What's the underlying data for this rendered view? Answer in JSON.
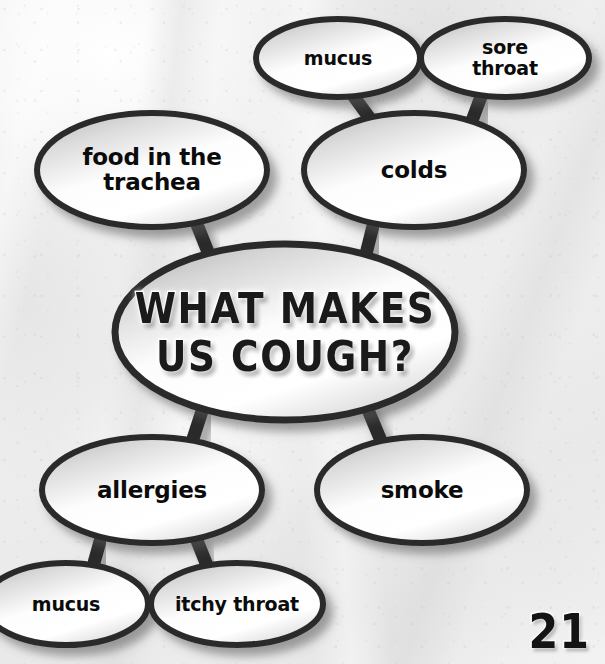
{
  "page": {
    "number": "21",
    "kind": "concept-map-worksheet",
    "palette": {
      "background": "#efefef",
      "ellipse_outline": "#2b2b2b",
      "ellipse_fill_light": "#ffffff",
      "ellipse_fill_shade": "#b9b9b9",
      "text": "#0b0b0b",
      "title_fill": "#1a1a1a",
      "title_outline": "#ffffff"
    }
  },
  "diagram": {
    "title_lines": [
      "WHAT MAKES",
      "US COUGH?"
    ],
    "center_node": {
      "id": "center",
      "label": "WHAT MAKES\nUS COUGH?",
      "cx": 285,
      "cy": 332,
      "rx": 170,
      "ry": 88
    },
    "nodes": [
      {
        "id": "mucus-top",
        "label": "mucus",
        "cx": 338,
        "cy": 58,
        "rx": 82,
        "ry": 39,
        "size": "sm"
      },
      {
        "id": "sore-throat",
        "label": "sore throat",
        "cx": 505,
        "cy": 58,
        "rx": 84,
        "ry": 39,
        "size": "sm"
      },
      {
        "id": "trachea",
        "label": "food in the\ntrachea",
        "cx": 152,
        "cy": 170,
        "rx": 115,
        "ry": 57,
        "size": "md"
      },
      {
        "id": "colds",
        "label": "colds",
        "cx": 414,
        "cy": 170,
        "rx": 110,
        "ry": 57,
        "size": "md"
      },
      {
        "id": "allergies",
        "label": "allergies",
        "cx": 152,
        "cy": 490,
        "rx": 110,
        "ry": 53,
        "size": "md"
      },
      {
        "id": "smoke",
        "label": "smoke",
        "cx": 422,
        "cy": 490,
        "rx": 105,
        "ry": 53,
        "size": "md"
      },
      {
        "id": "mucus-bottom",
        "label": "mucus",
        "cx": 66,
        "cy": 604,
        "rx": 82,
        "ry": 41,
        "size": "sm"
      },
      {
        "id": "itchy-throat",
        "label": "itchy throat",
        "cx": 237,
        "cy": 604,
        "rx": 86,
        "ry": 41,
        "size": "sm"
      }
    ],
    "connectors": [
      {
        "id": "mucus-top-to-colds",
        "from": "mucus-top",
        "to": "colds",
        "x1": 352,
        "y1": 94,
        "x2": 374,
        "y2": 124
      },
      {
        "id": "sore-throat-to-colds",
        "from": "sore-throat",
        "to": "colds",
        "x1": 482,
        "y1": 94,
        "x2": 470,
        "y2": 126
      },
      {
        "id": "trachea-to-center",
        "from": "trachea",
        "to": "center",
        "x1": 196,
        "y1": 222,
        "x2": 212,
        "y2": 262
      },
      {
        "id": "colds-to-center",
        "from": "colds",
        "to": "center",
        "x1": 374,
        "y1": 222,
        "x2": 364,
        "y2": 262
      },
      {
        "id": "center-to-allergies",
        "from": "center",
        "to": "allergies",
        "x1": 204,
        "y1": 405,
        "x2": 190,
        "y2": 448
      },
      {
        "id": "center-to-smoke",
        "from": "center",
        "to": "smoke",
        "x1": 366,
        "y1": 405,
        "x2": 384,
        "y2": 448
      },
      {
        "id": "allergies-to-mucus",
        "from": "allergies",
        "to": "mucus-bottom",
        "x1": 101,
        "y1": 538,
        "x2": 92,
        "y2": 570
      },
      {
        "id": "allergies-to-itchy",
        "from": "allergies",
        "to": "itchy-throat",
        "x1": 196,
        "y1": 538,
        "x2": 208,
        "y2": 568
      }
    ]
  }
}
